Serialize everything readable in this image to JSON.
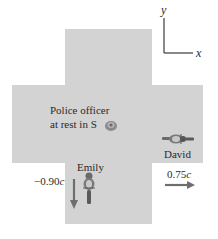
{
  "axes": {
    "x_label": "x",
    "y_label": "y"
  },
  "officer": {
    "line1": "Police officer",
    "line2": "at rest in S"
  },
  "emily": {
    "name": "Emily",
    "velocity_num": "−0.90",
    "velocity_unit": "c",
    "direction": "down"
  },
  "david": {
    "name": "David",
    "velocity_num": "0.75",
    "velocity_unit": "c",
    "direction": "right"
  },
  "colors": {
    "road": "#d3d3d3",
    "arrow": "#6e6e6e",
    "text": "#2a2a2a",
    "axis": "#4a4a4a"
  }
}
